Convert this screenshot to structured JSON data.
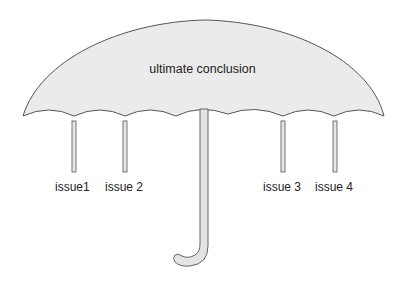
{
  "diagram": {
    "type": "umbrella",
    "canopy_label": "ultimate conclusion",
    "issues": [
      {
        "label": "issue1",
        "x": 74
      },
      {
        "label": "issue 2",
        "x": 125
      },
      {
        "label": "issue 3",
        "x": 283
      },
      {
        "label": "issue 4",
        "x": 334
      }
    ],
    "colors": {
      "canopy_fill": "#ebebeb",
      "stroke": "#555555",
      "pole_fill": "#e4e4e4",
      "text": "#222222"
    }
  }
}
